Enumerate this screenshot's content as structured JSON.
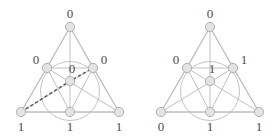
{
  "figure_count": 2,
  "canvas": {
    "width": 280,
    "height": 139
  },
  "colors": {
    "background": "#ffffff",
    "edge": "#b9b9b9",
    "dashed_edge": "#5a5a5a",
    "circle": "#bdbdbd",
    "node_fill": "#e3e3e3",
    "node_stroke": "#a9a9a9",
    "label_text": "#4c4c4c"
  },
  "geometry": {
    "node_radius": 4.6,
    "incircle_radius": 29.5,
    "nodes": {
      "apex": {
        "x": 70,
        "y": 27
      },
      "mid_left": {
        "x": 47,
        "y": 68
      },
      "mid_right": {
        "x": 93,
        "y": 68
      },
      "center": {
        "x": 70,
        "y": 81
      },
      "bottom_left": {
        "x": 21,
        "y": 112
      },
      "bottom_mid": {
        "x": 70,
        "y": 112
      },
      "bottom_right": {
        "x": 119,
        "y": 112
      }
    },
    "label_offsets": {
      "apex": {
        "dx": 0,
        "dy": -9
      },
      "mid_left": {
        "dx": -11,
        "dy": -4
      },
      "mid_right": {
        "dx": 11,
        "dy": -4
      },
      "center": {
        "dx": 2,
        "dy": -8
      },
      "bottom_left": {
        "dx": 0,
        "dy": 19
      },
      "bottom_mid": {
        "dx": 0,
        "dy": 19
      },
      "bottom_right": {
        "dx": 0,
        "dy": 19
      }
    }
  },
  "figures": [
    {
      "id": "left-figure",
      "name": "all-zero-interior-labeling",
      "labels": {
        "apex": "0",
        "mid_left": "0",
        "mid_right": "0",
        "center": "0",
        "bottom_left": "1",
        "bottom_mid": "1",
        "bottom_right": "1"
      },
      "has_dashed_path": true,
      "dashed_path": [
        "bottom_left",
        "center",
        "mid_right"
      ]
    },
    {
      "id": "right-figure",
      "name": "mixed-labeling",
      "labels": {
        "apex": "0",
        "mid_left": "0",
        "mid_right": "1",
        "center": "1",
        "bottom_left": "0",
        "bottom_mid": "1",
        "bottom_right": "1"
      },
      "has_dashed_path": false,
      "dashed_path": []
    }
  ]
}
